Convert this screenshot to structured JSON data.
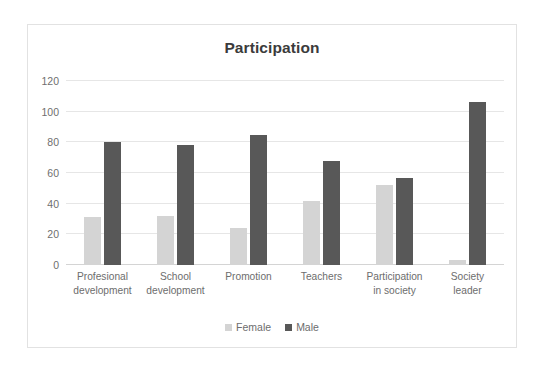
{
  "chart_data": {
    "type": "bar",
    "title": "Participation",
    "xlabel": "",
    "ylabel": "",
    "ylim": [
      0,
      120
    ],
    "yticks": [
      0,
      20,
      40,
      60,
      80,
      100,
      120
    ],
    "grid": true,
    "legend_position": "bottom",
    "categories": [
      "Profesional development",
      "School development",
      "Promotion",
      "Teachers",
      "Participation in society",
      "Society leader"
    ],
    "category_lines": [
      [
        "Profesional",
        "development"
      ],
      [
        "School",
        "development"
      ],
      [
        "Promotion"
      ],
      [
        "Teachers"
      ],
      [
        "Participation",
        "in society"
      ],
      [
        "Society",
        "leader"
      ]
    ],
    "series": [
      {
        "name": "Female",
        "color": "#d4d4d4",
        "values": [
          31,
          32,
          24,
          42,
          52,
          3
        ]
      },
      {
        "name": "Male",
        "color": "#585858",
        "values": [
          80,
          78,
          85,
          68,
          57,
          106
        ]
      }
    ]
  },
  "colors": {
    "female": "#d4d4d4",
    "male": "#585858",
    "gridline": "#e6e6e6",
    "axis_text": "#6d6d6d",
    "title_text": "#3b3b3b",
    "frame_border": "#e2e2e2",
    "background": "#ffffff"
  }
}
